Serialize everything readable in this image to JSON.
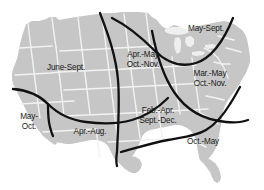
{
  "figure": {
    "type": "map",
    "background_color": "#ffffff",
    "land_color": "#c6c6c6",
    "state_border_color": "#f2f2f2",
    "division_line_color": "#111111",
    "label_color": "#1a1a1a"
  },
  "regions": [
    {
      "id": "northwest",
      "name": "June-Sept.",
      "lines": [
        "June-Sept."
      ],
      "x": 66,
      "y": 68
    },
    {
      "id": "north-central",
      "name": "Apr.-May Oct.-Nov.",
      "lines": [
        "Apr.-May",
        "Oct.-Nov."
      ],
      "x": 143,
      "y": 60
    },
    {
      "id": "northeast",
      "name": "May-Sept.",
      "lines": [
        "May-Sept."
      ],
      "x": 206,
      "y": 29
    },
    {
      "id": "east",
      "name": "Mar.-May Oct.-Nov.",
      "lines": [
        "Mar.-May",
        "Oct.-Nov."
      ],
      "x": 210,
      "y": 79
    },
    {
      "id": "south-central",
      "name": "Feb.-Apr. Sept.-Dec.",
      "lines": [
        "Feb.-Apr.",
        "Sept.-Dec."
      ],
      "x": 158,
      "y": 116
    },
    {
      "id": "southwest",
      "name": "May- Oct.",
      "lines": [
        "May-",
        "Oct."
      ],
      "x": 29,
      "y": 122
    },
    {
      "id": "south",
      "name": "Apr.-Aug.",
      "lines": [
        "Apr.-Aug."
      ],
      "x": 90,
      "y": 132
    },
    {
      "id": "southeast",
      "name": "Oct.-May",
      "lines": [
        "Oct.-May"
      ],
      "x": 203,
      "y": 142
    }
  ]
}
